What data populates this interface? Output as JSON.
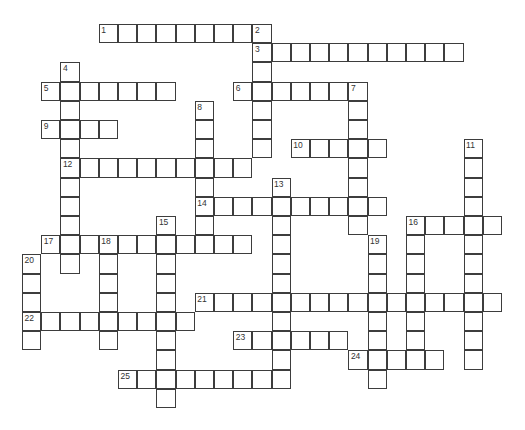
{
  "puzzle": {
    "type": "crossword",
    "grid": {
      "origin_x": 22,
      "origin_y": 24,
      "cell_size": 19.2,
      "line_color": "#3d3d3d",
      "cell_fill": "#ffffff",
      "number_color": "#333333"
    },
    "words": [
      {
        "number": 1,
        "direction": "across",
        "row": 0,
        "col": 4,
        "length": 9
      },
      {
        "number": 2,
        "direction": "down",
        "row": 0,
        "col": 12,
        "length": 7
      },
      {
        "number": 3,
        "direction": "across",
        "row": 1,
        "col": 12,
        "length": 11
      },
      {
        "number": 4,
        "direction": "down",
        "row": 2,
        "col": 2,
        "length": 11
      },
      {
        "number": 5,
        "direction": "across",
        "row": 3,
        "col": 1,
        "length": 7
      },
      {
        "number": 6,
        "direction": "across",
        "row": 3,
        "col": 11,
        "length": 7
      },
      {
        "number": 7,
        "direction": "down",
        "row": 3,
        "col": 17,
        "length": 8
      },
      {
        "number": 8,
        "direction": "down",
        "row": 4,
        "col": 9,
        "length": 8
      },
      {
        "number": 9,
        "direction": "across",
        "row": 5,
        "col": 1,
        "length": 4
      },
      {
        "number": 10,
        "direction": "across",
        "row": 6,
        "col": 14,
        "length": 5
      },
      {
        "number": 11,
        "direction": "down",
        "row": 6,
        "col": 23,
        "length": 12
      },
      {
        "number": 12,
        "direction": "across",
        "row": 7,
        "col": 2,
        "length": 10
      },
      {
        "number": 13,
        "direction": "down",
        "row": 8,
        "col": 13,
        "length": 11
      },
      {
        "number": 14,
        "direction": "across",
        "row": 9,
        "col": 9,
        "length": 10
      },
      {
        "number": 15,
        "direction": "down",
        "row": 10,
        "col": 7,
        "length": 10
      },
      {
        "number": 16,
        "direction": "across",
        "row": 10,
        "col": 20,
        "length": 5
      },
      {
        "number": 16,
        "direction": "down",
        "row": 10,
        "col": 20,
        "length": 8
      },
      {
        "number": 17,
        "direction": "across",
        "row": 11,
        "col": 1,
        "length": 11
      },
      {
        "number": 18,
        "direction": "down",
        "row": 11,
        "col": 4,
        "length": 6
      },
      {
        "number": 19,
        "direction": "down",
        "row": 11,
        "col": 18,
        "length": 8
      },
      {
        "number": 20,
        "direction": "down",
        "row": 12,
        "col": 0,
        "length": 5
      },
      {
        "number": 21,
        "direction": "across",
        "row": 14,
        "col": 9,
        "length": 16
      },
      {
        "number": 22,
        "direction": "across",
        "row": 15,
        "col": 0,
        "length": 9
      },
      {
        "number": 23,
        "direction": "across",
        "row": 16,
        "col": 11,
        "length": 6
      },
      {
        "number": 24,
        "direction": "across",
        "row": 17,
        "col": 17,
        "length": 5
      },
      {
        "number": 25,
        "direction": "across",
        "row": 18,
        "col": 5,
        "length": 9
      }
    ]
  }
}
